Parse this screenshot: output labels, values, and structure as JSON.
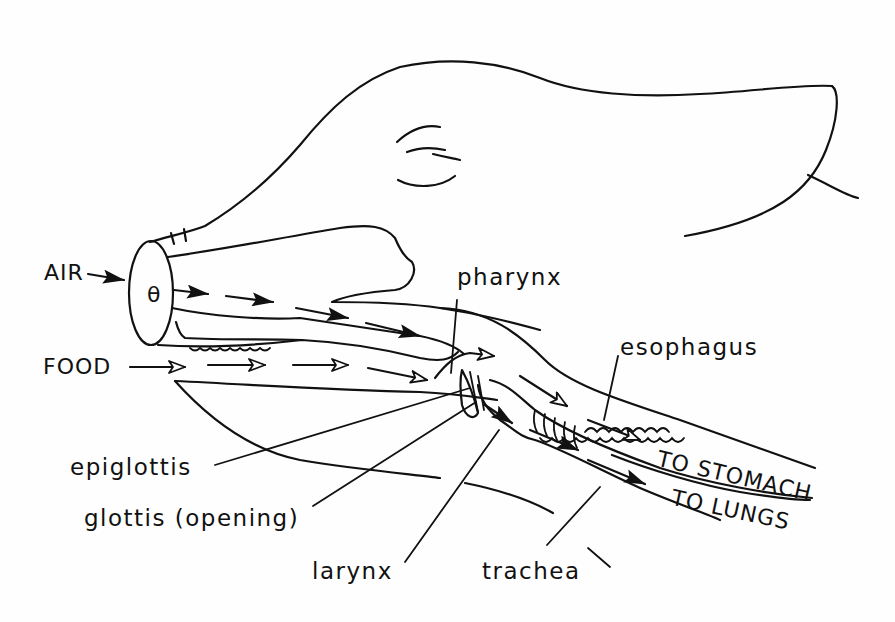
{
  "diagram": {
    "colors": {
      "ink": "#111111",
      "background": "#fefefe"
    },
    "flow_labels": {
      "air": "AIR",
      "food": "FOOD",
      "to_stomach": "TO STOMACH",
      "to_lungs": "TO LUNGS"
    },
    "anatomy_labels": {
      "pharynx": "pharynx",
      "esophagus": "esophagus",
      "epiglottis": "epiglottis",
      "glottis": "glottis (opening)",
      "larynx": "larynx",
      "trachea": "trachea"
    },
    "legend": {
      "air_arrow_style": "solid filled arrowheads",
      "food_arrow_style": "open outline arrowheads"
    }
  }
}
